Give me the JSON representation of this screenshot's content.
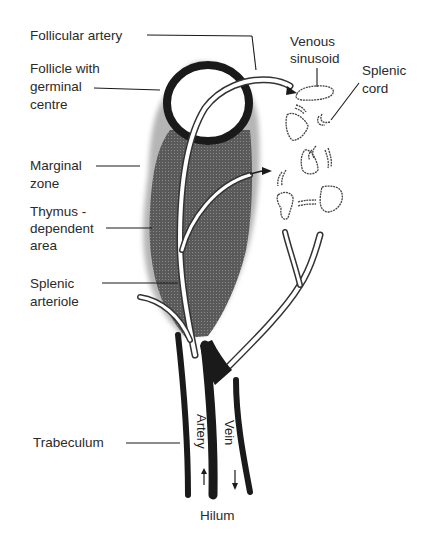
{
  "diagram": {
    "type": "anatomical-illustration",
    "labels": {
      "follicular_artery": "Follicular artery",
      "follicle_line1": "Follicle with",
      "follicle_line2": "germinal",
      "follicle_line3": "centre",
      "marginal_line1": "Marginal",
      "marginal_line2": "zone",
      "thymus_line1": "Thymus -",
      "thymus_line2": "dependent",
      "thymus_line3": "area",
      "arteriole_line1": "Splenic",
      "arteriole_line2": "arteriole",
      "trabeculum": "Trabeculum",
      "venous_line1": "Venous",
      "venous_line2": "sinusoid",
      "cord_line1": "Splenic",
      "cord_line2": "cord",
      "artery": "Artery",
      "vein": "Vein",
      "hilum": "Hilum"
    },
    "colors": {
      "ink": "#1a1a1a",
      "shaded_region": "#555555",
      "background": "#ffffff"
    }
  }
}
